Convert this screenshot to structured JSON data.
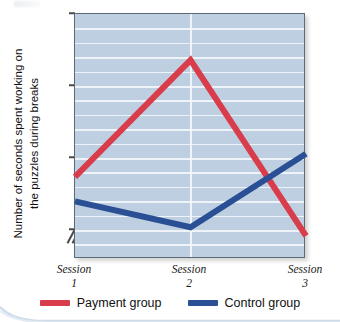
{
  "chart_data": {
    "type": "line",
    "title": "",
    "xlabel": "",
    "ylabel": "Number of seconds spent working on the puzzles during breaks",
    "categories": [
      "Session 1",
      "Session 2",
      "Session 3"
    ],
    "x_tick_lines": [
      [
        "Session",
        "1"
      ],
      [
        "Session",
        "2"
      ],
      [
        "Session",
        "3"
      ]
    ],
    "ylim": [
      180,
      350
    ],
    "y_ticks": [
      350,
      300,
      250,
      200
    ],
    "y_tick_labels": [
      "350",
      "300",
      "250",
      "200"
    ],
    "gridlines": true,
    "grid_step": 10,
    "axis_break": true,
    "legend_position": "bottom",
    "series": [
      {
        "name": "Payment group",
        "color": "#d93c4a",
        "values": [
          237,
          318,
          196
        ]
      },
      {
        "name": "Control group",
        "color": "#2a4f94",
        "values": [
          220,
          202,
          253
        ]
      }
    ]
  },
  "axis": {
    "y_label": "Number of seconds spent working on the puzzles during breaks",
    "ticks": {
      "t350": "350",
      "t300": "300",
      "t250": "250",
      "t200": "200"
    },
    "x": {
      "s1_word": "Session",
      "s1_num": "1",
      "s2_word": "Session",
      "s2_num": "2",
      "s3_word": "Session",
      "s3_num": "3"
    }
  },
  "legend": {
    "payment_label": "Payment group",
    "control_label": "Control group"
  },
  "colors": {
    "payment": "#d93c4a",
    "control": "#2a4f94",
    "plot_background": "#bdcfe0",
    "gridline": "#f2f6fa",
    "axis": "#5c6a78"
  }
}
